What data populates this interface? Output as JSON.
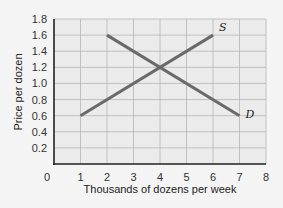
{
  "chart_data": {
    "type": "line",
    "title": "",
    "xlabel": "Thousands of dozens per week",
    "ylabel": "Price per dozen",
    "xlim": [
      0,
      8
    ],
    "ylim": [
      0,
      1.8
    ],
    "x_ticks": [
      "0",
      "1",
      "2",
      "3",
      "4",
      "5",
      "6",
      "7",
      "8"
    ],
    "y_ticks": [
      "0.2",
      "0.4",
      "0.6",
      "0.8",
      "1.0",
      "1.2",
      "1.4",
      "1.6",
      "1.8"
    ],
    "grid": true,
    "legend": "none",
    "series": [
      {
        "name": "S",
        "label": "S",
        "x": [
          1,
          6
        ],
        "y": [
          0.6,
          1.6
        ]
      },
      {
        "name": "D",
        "label": "D",
        "x": [
          2,
          7
        ],
        "y": [
          1.6,
          0.6
        ]
      }
    ],
    "colors": {
      "background": "#f4f4f4",
      "plot_area": "#ebebeb",
      "grid": "#b5b5b5",
      "axis": "#222222",
      "line": "#6a6a6a"
    }
  }
}
